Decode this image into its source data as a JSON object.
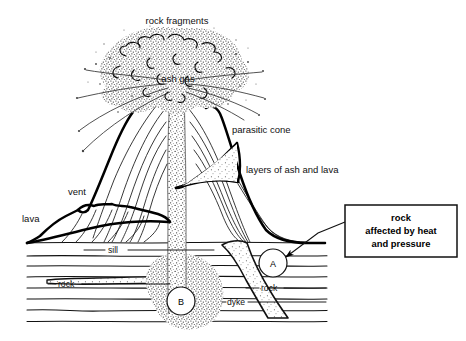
{
  "diagram": {
    "background_color": "#ffffff",
    "ink_color": "#000000",
    "labels": {
      "rock_fragments": "rock fragments",
      "ash_gas": "ash gas",
      "parasitic_cone": "parasitic cone",
      "layers_of_ash_and_lava": "layers of ash and lava",
      "vent": "vent",
      "lava": "lava",
      "sill": "sill",
      "rock_left": "rock",
      "rock_right": "rock",
      "dyke": "dyke"
    },
    "markers": {
      "a": "A",
      "b": "B"
    },
    "callout": {
      "line1": "rock",
      "line2": "affected by heat",
      "line3": "and pressure"
    }
  }
}
